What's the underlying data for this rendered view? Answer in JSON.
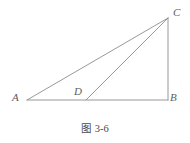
{
  "figure": {
    "caption_prefix": "图",
    "caption_index": "3-6",
    "caption_full": "图 3-6",
    "line_color": "#8d8d8d",
    "label_color": "#5d5d5d",
    "background_color": "#ffffff",
    "vertices": [
      {
        "id": "A",
        "label": "A",
        "x": 27,
        "y": 100
      },
      {
        "id": "B",
        "label": "B",
        "x": 168,
        "y": 100
      },
      {
        "id": "C",
        "label": "C",
        "x": 168,
        "y": 18
      },
      {
        "id": "D",
        "label": "D",
        "x": 86,
        "y": 100
      }
    ],
    "segments": [
      {
        "id": "AB",
        "from": "A",
        "to": "B",
        "name": "base-line-ab"
      },
      {
        "id": "AC",
        "from": "A",
        "to": "C",
        "name": "hypotenuse-line-ac"
      },
      {
        "id": "BC",
        "from": "B",
        "to": "C",
        "name": "vertical-line-bc"
      },
      {
        "id": "DC",
        "from": "D",
        "to": "C",
        "name": "cevian-line-dc"
      }
    ]
  },
  "chart_data": {
    "type": "diagram",
    "shape": "right triangle with cevian",
    "points": {
      "A": [
        27,
        100
      ],
      "B": [
        168,
        100
      ],
      "C": [
        168,
        18
      ],
      "D": [
        86,
        100
      ]
    },
    "edges": [
      "AB",
      "AC",
      "BC",
      "DC"
    ],
    "right_angle_at": "B"
  }
}
